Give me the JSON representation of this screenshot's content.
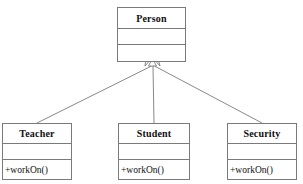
{
  "diagram": {
    "type": "uml-class-diagram",
    "relationship": "generalization",
    "line_color": "#7a7a7a",
    "background": "#ffffff"
  },
  "classes": {
    "person": {
      "name": "Person",
      "attributes": "",
      "operations": ""
    },
    "teacher": {
      "name": "Teacher",
      "attributes": "",
      "operations": "+workOn()"
    },
    "student": {
      "name": "Student",
      "attributes": "",
      "operations": "+workOn()"
    },
    "security": {
      "name": "Security",
      "attributes": "",
      "operations": "+workOn()"
    }
  },
  "edges": [
    {
      "from": "person",
      "to": "teacher",
      "kind": "generalization"
    },
    {
      "from": "person",
      "to": "student",
      "kind": "generalization"
    },
    {
      "from": "person",
      "to": "security",
      "kind": "generalization"
    }
  ]
}
